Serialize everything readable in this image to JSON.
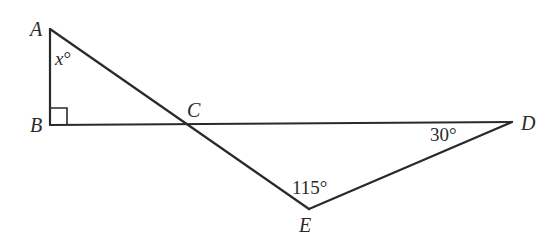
{
  "diagram": {
    "points": {
      "A": {
        "label": "A",
        "x": 50,
        "y": 29
      },
      "B": {
        "label": "B",
        "x": 50,
        "y": 125
      },
      "C": {
        "label": "C",
        "x": 182,
        "y": 124
      },
      "D": {
        "label": "D",
        "x": 512,
        "y": 122
      },
      "E": {
        "label": "E",
        "x": 309,
        "y": 209
      }
    },
    "segments": [
      [
        "A",
        "B"
      ],
      [
        "B",
        "D"
      ],
      [
        "A",
        "E"
      ],
      [
        "E",
        "D"
      ]
    ],
    "angles": {
      "A": {
        "var": "x",
        "unit": "°"
      },
      "B": {
        "text": "right angle"
      },
      "D": {
        "text": "30°"
      },
      "E": {
        "text": "115°"
      }
    }
  }
}
